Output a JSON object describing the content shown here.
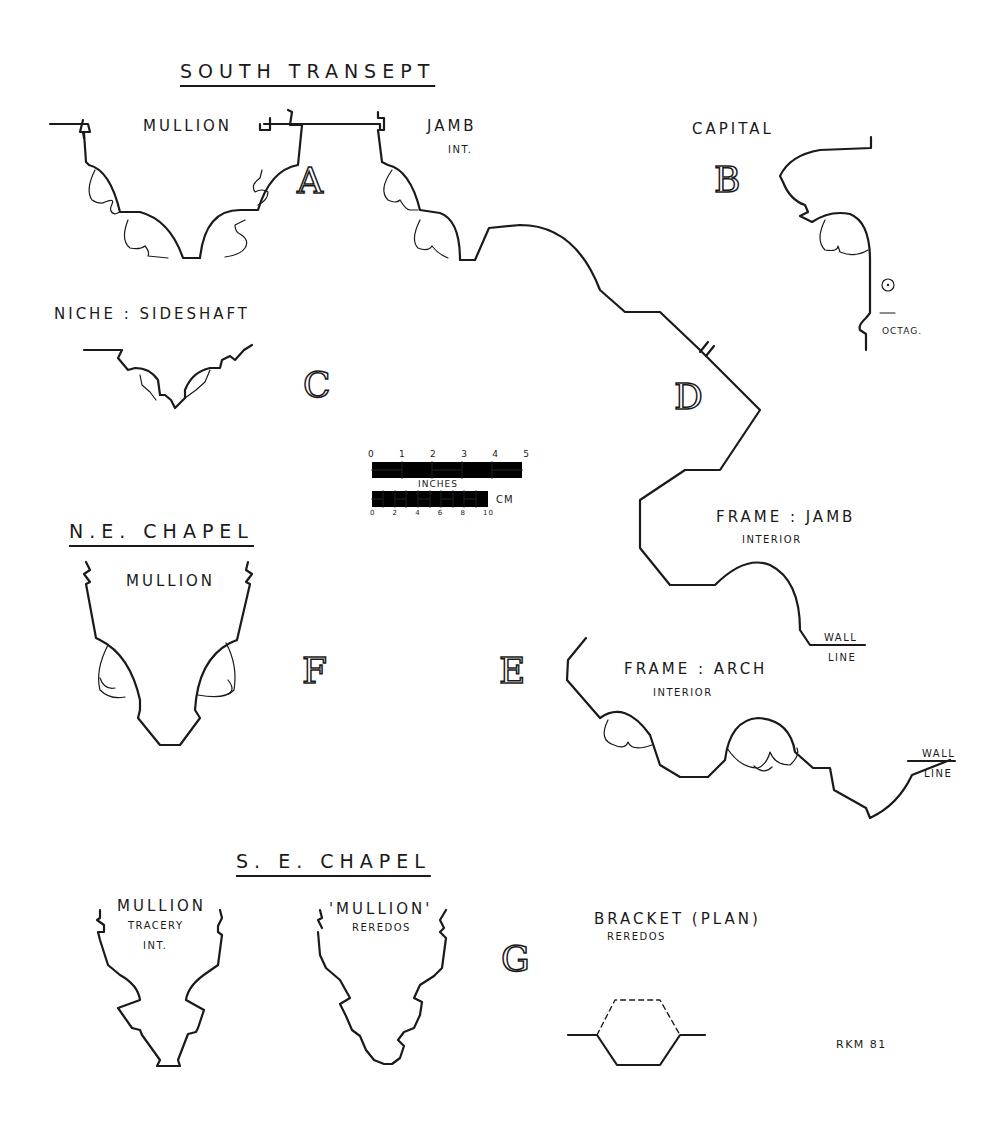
{
  "sections": {
    "south_transept": {
      "title": "SOUTH TRANSEPT",
      "mullion_label": "MULLION",
      "jamb_label": "JAMB",
      "jamb_sublabel": "INT.",
      "letter_a": "A",
      "capital_label": "CAPITAL",
      "letter_b": "B",
      "octag_label": "OCTAG.",
      "niche_label": "NICHE : SIDESHAFT",
      "letter_c": "C",
      "letter_d": "D",
      "frame_jamb_label": "FRAME : JAMB",
      "frame_jamb_sublabel": "INTERIOR",
      "wall_line_1": "WALL",
      "wall_line_1b": "LINE",
      "letter_e": "E",
      "frame_arch_label": "FRAME : ARCH",
      "frame_arch_sublabel": "INTERIOR",
      "wall_line_2": "WALL",
      "wall_line_2b": "LINE"
    },
    "ne_chapel": {
      "title": "N.E. CHAPEL",
      "mullion_label": "MULLION",
      "letter_f": "F"
    },
    "se_chapel": {
      "title": "S. E. CHAPEL",
      "mullion_label": "MULLION",
      "mullion_sub1": "TRACERY",
      "mullion_sub2": "INT.",
      "mullion2_label": "'MULLION'",
      "mullion2_sub": "REREDOS",
      "letter_g": "G",
      "bracket_label": "BRACKET (PLAN)",
      "bracket_sub": "REREDOS"
    }
  },
  "scale_bar": {
    "inch_ticks": [
      "0",
      "1",
      "2",
      "3",
      "4",
      "5"
    ],
    "inch_unit": "INCHES",
    "cm_ticks": [
      "0",
      "2",
      "4",
      "6",
      "8",
      "10"
    ],
    "cm_unit": "CM"
  },
  "signature": "RKM 81"
}
